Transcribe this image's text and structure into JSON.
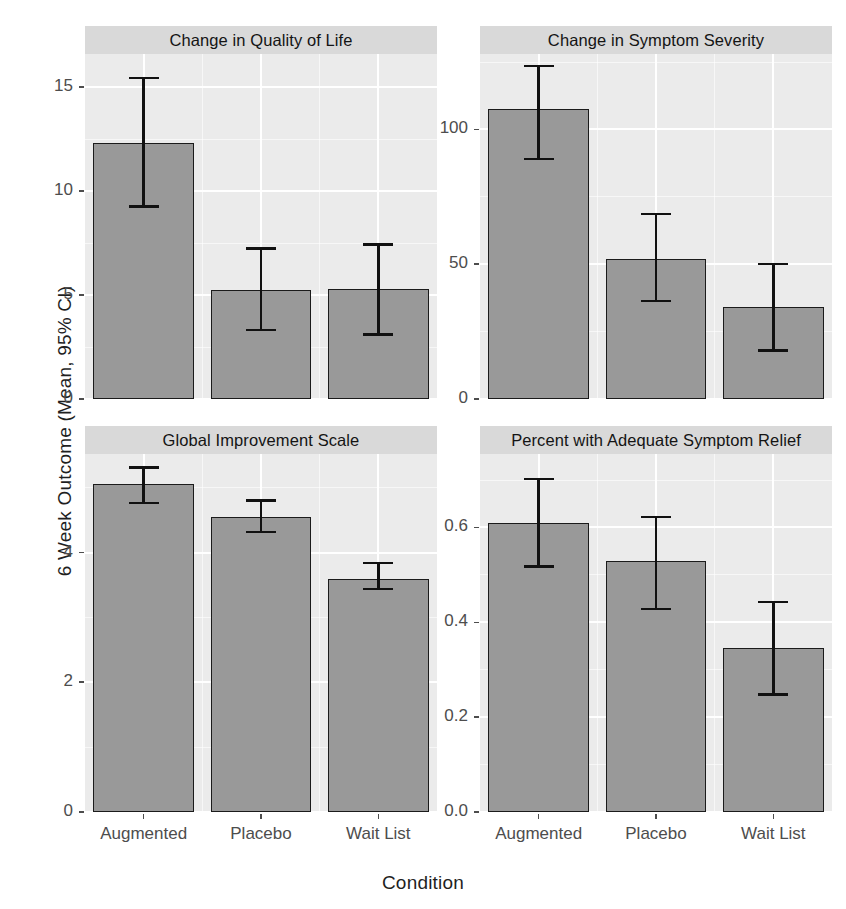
{
  "chart_data": {
    "type": "bar",
    "title": "",
    "xlabel": "Condition",
    "ylabel": "6 Week Outcome (Mean, 95% CI)",
    "categories": [
      "Augmented",
      "Placebo",
      "Wait List"
    ],
    "grid": true,
    "legend": "none",
    "facet_layout": "2x2",
    "error_bars": "95% CI",
    "colors": {
      "bar_fill": "#999999",
      "bar_outline": "#1b1b1b",
      "panel_background": "#ebebeb",
      "strip_background": "#d9d9d9",
      "grid_line": "#ffffff",
      "error_bar": "#111111",
      "tick_label": "#4d4d4d",
      "axis_title": "#1f1f1f"
    },
    "panels": [
      {
        "title": "Change in Quality of Life",
        "ylim": [
          0,
          16.6
        ],
        "yticks": [
          0,
          5,
          10,
          15
        ],
        "ytick_labels": [
          "0",
          "5",
          "10",
          "15"
        ],
        "yminor": [
          2.5,
          7.5,
          12.5
        ],
        "values": [
          12.3,
          5.25,
          5.3
        ],
        "ci_low": [
          9.2,
          3.25,
          3.05
        ],
        "ci_high": [
          15.5,
          7.3,
          7.5
        ]
      },
      {
        "title": "Change in Symptom Severity",
        "ylim": [
          0,
          128
        ],
        "yticks": [
          0,
          50,
          100
        ],
        "ytick_labels": [
          "0",
          "50",
          "100"
        ],
        "yminor": [
          25,
          75,
          125
        ],
        "values": [
          107.5,
          52.0,
          34.0
        ],
        "ci_low": [
          88.5,
          36.0,
          17.5
        ],
        "ci_high": [
          124.0,
          69.0,
          50.5
        ]
      },
      {
        "title": "Global Improvement Scale",
        "ylim": [
          0,
          5.52
        ],
        "yticks": [
          0,
          2,
          4
        ],
        "ytick_labels": [
          "0",
          "2",
          "4"
        ],
        "yminor": [
          1,
          3,
          5
        ],
        "values": [
          5.05,
          4.55,
          3.6
        ],
        "ci_low": [
          4.75,
          4.3,
          3.42
        ],
        "ci_high": [
          5.33,
          4.82,
          3.86
        ]
      },
      {
        "title": "Percent with Adequate Symptom Relief",
        "ylim": [
          0,
          0.755
        ],
        "yticks": [
          0.0,
          0.2,
          0.4,
          0.6
        ],
        "ytick_labels": [
          "0.0",
          "0.2",
          "0.4",
          "0.6"
        ],
        "yminor": [
          0.1,
          0.3,
          0.5,
          0.7
        ],
        "values": [
          0.61,
          0.53,
          0.345
        ],
        "ci_low": [
          0.515,
          0.425,
          0.245
        ],
        "ci_high": [
          0.705,
          0.625,
          0.445
        ]
      }
    ]
  },
  "axis": {
    "x_title": "Condition",
    "y_title": "6 Week Outcome (Mean, 95% CI)"
  }
}
